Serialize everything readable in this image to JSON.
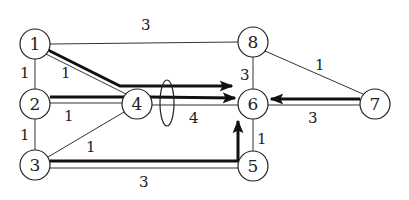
{
  "diagram": {
    "type": "network-flow-graph",
    "nodes": [
      {
        "id": "1",
        "label": "1",
        "x": 35,
        "y": 44
      },
      {
        "id": "2",
        "label": "2",
        "x": 35,
        "y": 104
      },
      {
        "id": "3",
        "label": "3",
        "x": 35,
        "y": 165
      },
      {
        "id": "4",
        "label": "4",
        "x": 137,
        "y": 104
      },
      {
        "id": "5",
        "label": "5",
        "x": 253,
        "y": 166
      },
      {
        "id": "6",
        "label": "6",
        "x": 253,
        "y": 104
      },
      {
        "id": "7",
        "label": "7",
        "x": 375,
        "y": 104
      },
      {
        "id": "8",
        "label": "8",
        "x": 253,
        "y": 42
      }
    ],
    "edges": [
      {
        "from": "1",
        "to": "8",
        "weight": "3"
      },
      {
        "from": "1",
        "to": "2",
        "weight": "1"
      },
      {
        "from": "1",
        "to": "4",
        "weight": "1"
      },
      {
        "from": "2",
        "to": "4",
        "weight": "1"
      },
      {
        "from": "2",
        "to": "3",
        "weight": "1"
      },
      {
        "from": "3",
        "to": "4",
        "weight": "1"
      },
      {
        "from": "3",
        "to": "5",
        "weight": "3"
      },
      {
        "from": "4",
        "to": "6",
        "weight": "4"
      },
      {
        "from": "8",
        "to": "6",
        "weight": "3"
      },
      {
        "from": "8",
        "to": "7",
        "weight": "1"
      },
      {
        "from": "7",
        "to": "6",
        "weight": "3"
      },
      {
        "from": "5",
        "to": "6",
        "weight": "1"
      }
    ],
    "flow_paths": [
      {
        "name": "path-1-to-6",
        "via": [
          "1",
          "4",
          "6"
        ],
        "direction": "to-6"
      },
      {
        "name": "path-2-to-6",
        "via": [
          "2",
          "4",
          "6"
        ],
        "direction": "to-6"
      },
      {
        "name": "path-3-to-6",
        "via": [
          "3",
          "5",
          "6"
        ],
        "direction": "to-6"
      },
      {
        "name": "path-7-to-6",
        "via": [
          "7",
          "6"
        ],
        "direction": "to-6"
      }
    ],
    "cut_marker": {
      "shape": "ellipse",
      "on_edge": "4-6"
    }
  }
}
